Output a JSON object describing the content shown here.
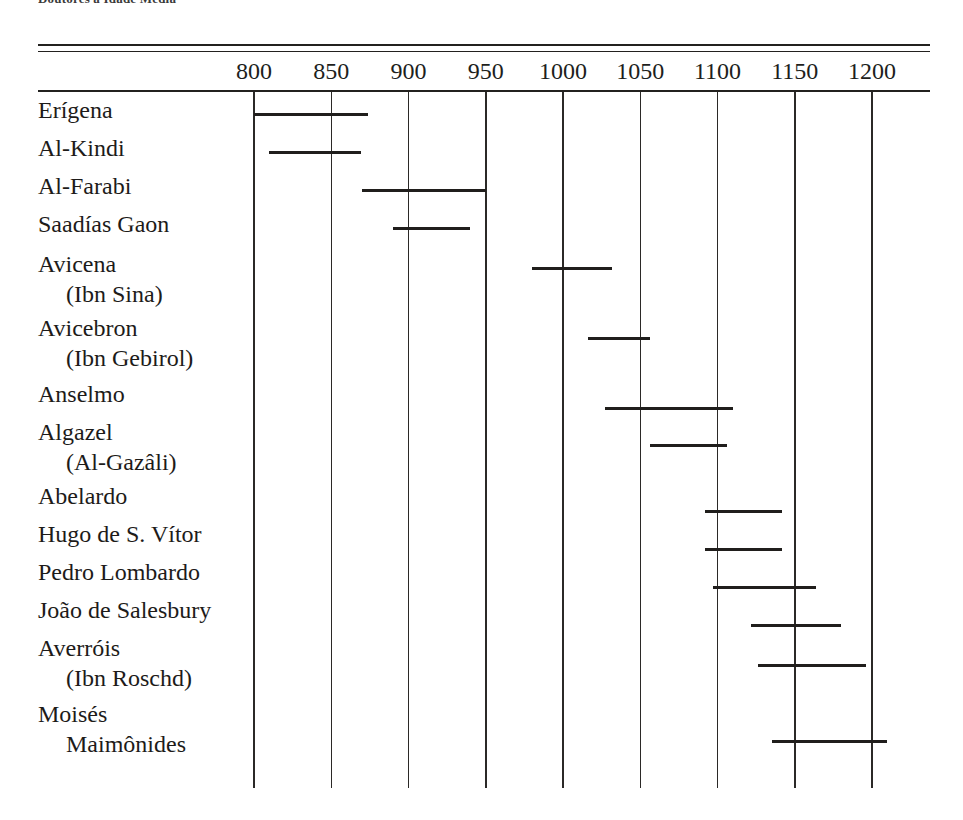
{
  "caption": {
    "partial_text": "Doutores a Idade Media"
  },
  "chart_data": {
    "type": "bar",
    "orientation": "horizontal-range",
    "title": "",
    "subtitle": "",
    "xlabel": "",
    "ylabel": "",
    "xlim": [
      775,
      1225
    ],
    "grid": true,
    "legend": "none",
    "xticks": [
      800,
      850,
      900,
      950,
      1000,
      1050,
      1100,
      1150,
      1200
    ],
    "xtick_labels": [
      "800",
      "850",
      "900",
      "950",
      "1000",
      "1050",
      "1100",
      "1150",
      "1200"
    ],
    "categories": [
      "Erígena",
      "Al-Kindi",
      "Al-Farabi",
      "Saadías Gaon",
      "Avicena (Ibn Sina)",
      "Avicebron (Ibn Gebirol)",
      "Anselmo",
      "Algazel (Al-Gazâli)",
      "Abelardo",
      "Hugo de S. Vítor",
      "Pedro Lombardo",
      "João de Salesbury",
      "Averróis (Ibn Roschd)",
      "Moisés Maimônides"
    ],
    "ranges": [
      [
        800,
        874
      ],
      [
        810,
        869
      ],
      [
        870,
        950
      ],
      [
        890,
        940
      ],
      [
        980,
        1032
      ],
      [
        1016,
        1056
      ],
      [
        1027,
        1110
      ],
      [
        1056,
        1106
      ],
      [
        1092,
        1142
      ],
      [
        1092,
        1142
      ],
      [
        1097,
        1164
      ],
      [
        1122,
        1180
      ],
      [
        1126,
        1196
      ],
      [
        1135,
        1210
      ]
    ]
  },
  "rows": [
    {
      "name": "Erígena",
      "sub": "",
      "start": 800,
      "end": 874
    },
    {
      "name": "Al-Kindi",
      "sub": "",
      "start": 810,
      "end": 869
    },
    {
      "name": "Al-Farabi",
      "sub": "",
      "start": 870,
      "end": 950
    },
    {
      "name": "Saadías Gaon",
      "sub": "",
      "start": 890,
      "end": 940
    },
    {
      "name": "Avicena",
      "sub": "(Ibn Sina)",
      "start": 980,
      "end": 1032
    },
    {
      "name": "Avicebron",
      "sub": "(Ibn Gebirol)",
      "start": 1016,
      "end": 1056
    },
    {
      "name": "Anselmo",
      "sub": "",
      "start": 1027,
      "end": 1110
    },
    {
      "name": "Algazel",
      "sub": "(Al-Gazâli)",
      "start": 1056,
      "end": 1106
    },
    {
      "name": "Abelardo",
      "sub": "",
      "start": 1092,
      "end": 1142
    },
    {
      "name": "Hugo de S. Vítor",
      "sub": "",
      "start": 1092,
      "end": 1142
    },
    {
      "name": "Pedro Lombardo",
      "sub": "",
      "start": 1097,
      "end": 1164
    },
    {
      "name": "João de Salesbury",
      "sub": "",
      "start": 1122,
      "end": 1180
    },
    {
      "name": "Averróis",
      "sub": "(Ibn Roschd)",
      "start": 1126,
      "end": 1196
    },
    {
      "name": "Moisés",
      "sub": "Maimônides",
      "start": 1135,
      "end": 1210
    }
  ],
  "style": {
    "ink": "#201e1c",
    "paper": "#ffffff"
  }
}
